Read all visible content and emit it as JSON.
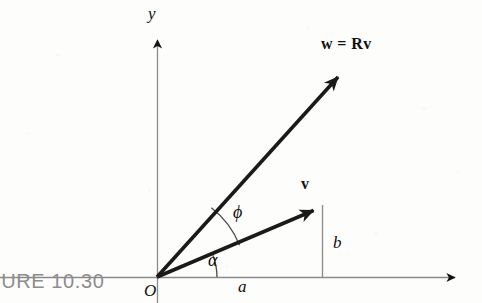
{
  "figure": {
    "caption": "FIGURE 10.30",
    "caption_visible_text": "RE 10.30",
    "background_color": "#fdfdfc",
    "axis_color": "#8a8a8a",
    "vector_color": "#1a1a1a",
    "arc_color": "#555555",
    "label_color": "#111111",
    "caption_color": "#8d8d8d"
  },
  "axes": {
    "origin_label": "O",
    "x_axis_label": "",
    "y_axis_label": "y",
    "origin_px": {
      "x": 157,
      "y": 277
    },
    "x_axis_from_px": {
      "x": 0,
      "y": 277
    },
    "x_axis_to_px": {
      "x": 466,
      "y": 277
    },
    "y_axis_from_px": {
      "x": 157,
      "y": 303
    },
    "y_axis_to_px": {
      "x": 157,
      "y": 30
    }
  },
  "vectors": [
    {
      "name": "v",
      "label": "v",
      "label_style": "bold",
      "tip_px": {
        "x": 322,
        "y": 205
      },
      "angle_from_x_axis_deg": 21.2,
      "components": {
        "x_component_label": "a",
        "y_component_label": "b"
      }
    },
    {
      "name": "w",
      "label": "w = Rv",
      "label_lhs": "w",
      "label_operator": "=",
      "label_rhs_matrix": "R",
      "label_rhs_vector": "v",
      "label_style": "bold",
      "tip_px": {
        "x": 345,
        "y": 70
      },
      "angle_from_x_axis_deg": 51.9
    }
  ],
  "angles": [
    {
      "name": "alpha",
      "symbol": "α",
      "description": "angle from x-axis to vector v",
      "value_deg": 21.2,
      "arc_radius_px": 60,
      "label_px": {
        "x": 215,
        "y": 261
      }
    },
    {
      "name": "phi",
      "symbol": "ϕ",
      "description": "rotation angle from vector v to vector w",
      "value_deg": 30.7,
      "arc_radius_px": 88,
      "label_px": {
        "x": 240,
        "y": 213
      }
    }
  ],
  "components": [
    {
      "name": "a",
      "symbol": "a",
      "description": "horizontal component of v along x-axis",
      "label_px": {
        "x": 243,
        "y": 286
      }
    },
    {
      "name": "b",
      "symbol": "b",
      "description": "vertical component of v, dropped from tip of v to x-axis",
      "label_px": {
        "x": 337,
        "y": 243
      }
    }
  ]
}
